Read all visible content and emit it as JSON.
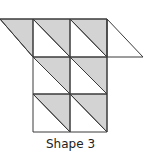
{
  "figure": {
    "label": "Shape 3",
    "colors": {
      "shade": "#d3d3d3",
      "stroke": "#3a3a3a",
      "background": "#ffffff"
    },
    "grid": {
      "x": [
        33,
        70,
        107
      ],
      "y": [
        19,
        57,
        94,
        132
      ]
    },
    "shaded_triangles": [
      [
        [
          0,
          19
        ],
        [
          33,
          19
        ],
        [
          33,
          57
        ]
      ],
      [
        [
          33,
          19
        ],
        [
          70,
          19
        ],
        [
          70,
          57
        ]
      ],
      [
        [
          70,
          19
        ],
        [
          107,
          19
        ],
        [
          107,
          57
        ]
      ],
      [
        [
          33,
          57
        ],
        [
          70,
          57
        ],
        [
          70,
          94
        ]
      ],
      [
        [
          70,
          57
        ],
        [
          107,
          57
        ],
        [
          107,
          94
        ]
      ],
      [
        [
          33,
          94
        ],
        [
          70,
          94
        ],
        [
          70,
          132
        ]
      ],
      [
        [
          70,
          94
        ],
        [
          107,
          94
        ],
        [
          107,
          132
        ]
      ]
    ],
    "unshaded_triangle": [
      [
        107,
        19
      ],
      [
        107,
        57
      ],
      [
        143,
        57
      ]
    ]
  }
}
